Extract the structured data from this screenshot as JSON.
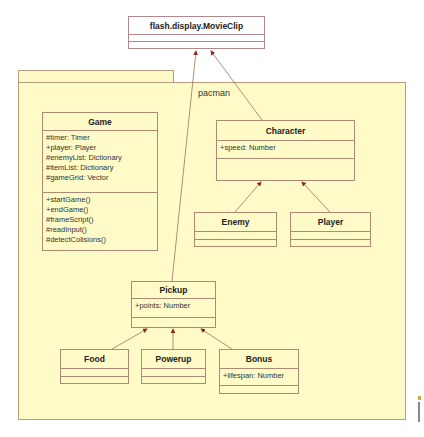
{
  "diagram": {
    "type": "UML class diagram",
    "package": {
      "name": "pacman"
    },
    "classes": {
      "movieclip": {
        "name": "flash.display.MovieClip",
        "attributes": [],
        "methods": []
      },
      "game": {
        "name": "Game",
        "attributes": [
          "#timer: Timer",
          "+player: Player",
          "#enemyList: Dictionary",
          "#itemList: Dictionary",
          "#gameGrid: Vector"
        ],
        "methods": [
          "+startGame()",
          "+endGame()",
          "#frameScript()",
          "#readInput()",
          "#detectColisions()"
        ]
      },
      "character": {
        "name": "Character",
        "attributes": [
          "+speed: Number"
        ],
        "methods": []
      },
      "enemy": {
        "name": "Enemy",
        "attributes": [],
        "methods": []
      },
      "player": {
        "name": "Player",
        "attributes": [],
        "methods": []
      },
      "pickup": {
        "name": "Pickup",
        "attributes": [
          "+points: Number"
        ],
        "methods": []
      },
      "food": {
        "name": "Food",
        "attributes": [],
        "methods": []
      },
      "powerup": {
        "name": "Powerup",
        "attributes": [],
        "methods": []
      },
      "bonus": {
        "name": "Bonus",
        "attributes": [
          "+lifespan: Number"
        ],
        "methods": []
      }
    },
    "relations": [
      {
        "type": "generalization",
        "from": "Pickup",
        "to": "flash.display.MovieClip"
      },
      {
        "type": "generalization",
        "from": "Character",
        "to": "flash.display.MovieClip"
      },
      {
        "type": "generalization",
        "from": "Enemy",
        "to": "Character"
      },
      {
        "type": "generalization",
        "from": "Player",
        "to": "Character"
      },
      {
        "type": "generalization",
        "from": "Food",
        "to": "Pickup"
      },
      {
        "type": "generalization",
        "from": "Powerup",
        "to": "Pickup"
      },
      {
        "type": "generalization",
        "from": "Bonus",
        "to": "Pickup"
      }
    ],
    "colors": {
      "package_fill": "#fffbc8",
      "border": "#b08a70",
      "line": "#a0705a",
      "arrow": "#8b2a1a"
    }
  }
}
